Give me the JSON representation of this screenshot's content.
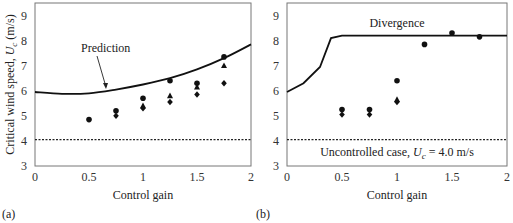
{
  "chart_data": [
    {
      "type": "scatter",
      "panel_label": "(a)",
      "xlabel": "Control gain",
      "ylabel": "Critical wind speed, U_c (m/s)",
      "ylabel_parts": {
        "pre": "Critical wind speed, ",
        "var": "U",
        "sub": "c",
        "post": " (m/s)"
      },
      "xlim": [
        0,
        2
      ],
      "ylim": [
        3,
        9.5
      ],
      "xticks": [
        "0",
        "0.5",
        "1",
        "1.5",
        "2"
      ],
      "yticks": [
        "3",
        "4",
        "5",
        "6",
        "7",
        "8",
        "9"
      ],
      "grid": false,
      "annotations": [
        {
          "text": "Prediction",
          "arrow_to": [
            0.65,
            5.95
          ]
        }
      ],
      "reference_line": {
        "y": 4.05,
        "style": "dotted"
      },
      "prediction_curve": {
        "x": [
          0,
          0.25,
          0.5,
          0.75,
          1.0,
          1.25,
          1.5,
          1.75,
          2.0
        ],
        "y": [
          5.95,
          5.88,
          5.9,
          6.05,
          6.25,
          6.5,
          6.85,
          7.3,
          7.85
        ]
      },
      "series": [
        {
          "name": "circle",
          "marker": "circle",
          "x": [
            0.5,
            0.75,
            1.0,
            1.25,
            1.5,
            1.75
          ],
          "values": [
            4.85,
            5.2,
            5.7,
            6.4,
            6.3,
            7.35
          ]
        },
        {
          "name": "triangle",
          "marker": "triangle",
          "x": [
            1.0,
            1.25,
            1.5,
            1.75
          ],
          "values": [
            5.4,
            5.8,
            6.15,
            7.0
          ]
        },
        {
          "name": "diamond",
          "marker": "diamond",
          "x": [
            0.75,
            1.0,
            1.25,
            1.5,
            1.75
          ],
          "values": [
            5.0,
            5.3,
            5.55,
            5.85,
            6.3
          ]
        }
      ]
    },
    {
      "type": "scatter",
      "panel_label": "(b)",
      "xlabel": "Control gain",
      "ylabel": "",
      "xlim": [
        0,
        2
      ],
      "ylim": [
        3,
        9.5
      ],
      "xticks": [
        "0",
        "0.5",
        "1",
        "1.5",
        "2"
      ],
      "yticks": [
        "3",
        "4",
        "5",
        "6",
        "7",
        "8",
        "9"
      ],
      "grid": false,
      "annotations": [
        {
          "text": "Divergence"
        },
        {
          "text": "Uncontrolled case, U_c = 4.0 m/s",
          "parts": {
            "pre": "Uncontrolled case, ",
            "var": "U",
            "sub": "c",
            "post": " = 4.0 m/s"
          }
        }
      ],
      "reference_line": {
        "y": 4.05,
        "style": "dotted"
      },
      "divergence_curve": {
        "x": [
          0,
          0.15,
          0.3,
          0.4,
          0.5,
          2.0
        ],
        "y": [
          5.95,
          6.3,
          6.95,
          8.1,
          8.2,
          8.2
        ]
      },
      "series": [
        {
          "name": "circle",
          "marker": "circle",
          "x": [
            0.5,
            0.75,
            1.0,
            1.25,
            1.5,
            1.75
          ],
          "values": [
            5.25,
            5.25,
            6.4,
            7.85,
            8.3,
            8.15
          ]
        },
        {
          "name": "triangle",
          "marker": "triangle",
          "x": [
            1.0
          ],
          "values": [
            5.65
          ]
        },
        {
          "name": "diamond",
          "marker": "diamond",
          "x": [
            0.5,
            0.75,
            1.0
          ],
          "values": [
            5.05,
            5.05,
            5.55
          ]
        }
      ]
    }
  ]
}
